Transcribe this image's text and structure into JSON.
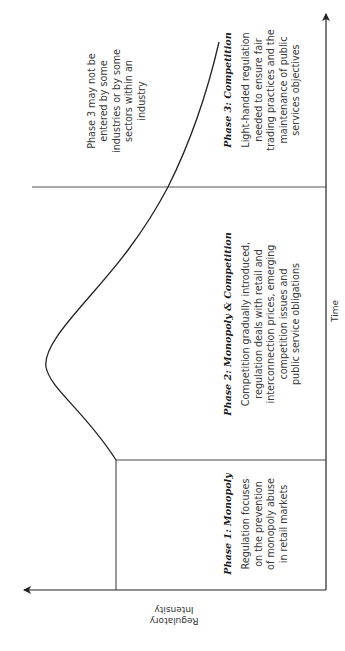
{
  "diagram": {
    "axes": {
      "x_label": "Time",
      "y_label": "Regulatory\nIntensity"
    },
    "phases": [
      {
        "title": "Phase 1: Monopoly",
        "description": "Regulation focuses\non the prevention\nof monopoly abuse\nin retail markets"
      },
      {
        "title": "Phase 2: Monopoly & Competition",
        "description": "Competition gradually introduced,\nregulation deals with retail and\ninterconnection prices, emerging\ncompetition issues and\npublic service obligations"
      },
      {
        "title": "Phase 3: Competition",
        "description": "Light-handed regulation\nneeded to ensure fair\ntrading practices and the\nmaintenance of public\nservices objectives"
      }
    ],
    "note": "Phase 3 may not be\nentered by some\nindustries or by some\nsectors within an\nindustry",
    "colors": {
      "line": "#222222",
      "divider": "#555555",
      "text": "#3a3a3a"
    },
    "orientation": "rotated 90° counter-clockwise"
  }
}
